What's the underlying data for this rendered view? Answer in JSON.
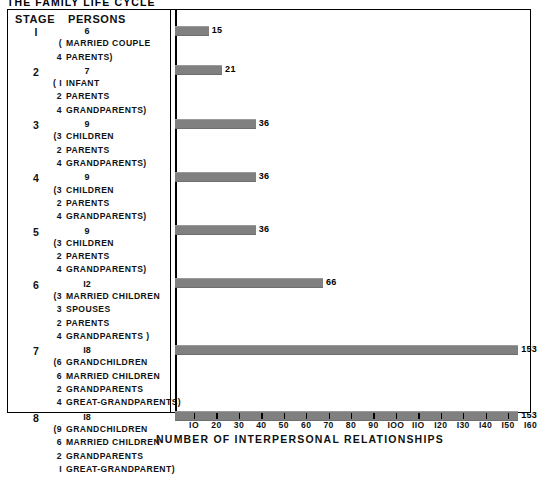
{
  "figure": {
    "title": "THE FAMILY LIFE CYCLE",
    "x_axis_title": "NUMBER OF INTERPERSONAL RELATIONSHIPS"
  },
  "table": {
    "headers": {
      "stage": "STAGE",
      "persons": "PERSONS"
    },
    "rows": [
      {
        "stage": "I",
        "persons": "6",
        "details": [
          {
            "count": "(",
            "text": "MARRIED COUPLE"
          },
          {
            "count": "4",
            "text": "PARENTS)"
          }
        ]
      },
      {
        "stage": "2",
        "persons": "7",
        "details": [
          {
            "count": "( I",
            "text": "INFANT"
          },
          {
            "count": "2",
            "text": "PARENTS"
          },
          {
            "count": "4",
            "text": "GRANDPARENTS)"
          }
        ]
      },
      {
        "stage": "3",
        "persons": "9",
        "details": [
          {
            "count": "(3",
            "text": "CHILDREN"
          },
          {
            "count": "2",
            "text": "PARENTS"
          },
          {
            "count": "4",
            "text": "GRANDPARENTS)"
          }
        ]
      },
      {
        "stage": "4",
        "persons": "9",
        "details": [
          {
            "count": "(3",
            "text": "CHILDREN"
          },
          {
            "count": "2",
            "text": "PARENTS"
          },
          {
            "count": "4",
            "text": "GRANDPARENTS)"
          }
        ]
      },
      {
        "stage": "5",
        "persons": "9",
        "details": [
          {
            "count": "(3",
            "text": "CHILDREN"
          },
          {
            "count": "2",
            "text": "PARENTS"
          },
          {
            "count": "4",
            "text": "GRANDPARENTS)"
          }
        ]
      },
      {
        "stage": "6",
        "persons": "I2",
        "details": [
          {
            "count": "(3",
            "text": "MARRIED CHILDREN"
          },
          {
            "count": "3",
            "text": "SPOUSES"
          },
          {
            "count": "2",
            "text": "PARENTS"
          },
          {
            "count": "4",
            "text": "GRANDPARENTS )"
          }
        ]
      },
      {
        "stage": "7",
        "persons": "I8",
        "details": [
          {
            "count": "(6",
            "text": "GRANDCHILDREN"
          },
          {
            "count": "6",
            "text": "MARRIED CHILDREN"
          },
          {
            "count": "2",
            "text": "GRANDPARENTS"
          },
          {
            "count": "4",
            "text": "GREAT-GRANDPARENTS)"
          }
        ]
      },
      {
        "stage": "8",
        "persons": "I8",
        "details": [
          {
            "count": "(9",
            "text": "GRANDCHILDREN"
          },
          {
            "count": "6",
            "text": "MARRIED CHILDREN"
          },
          {
            "count": "2",
            "text": "GRANDPARENTS"
          },
          {
            "count": "I",
            "text": "GREAT-GRANDPARENT)"
          }
        ]
      }
    ]
  },
  "chart_data": {
    "type": "bar",
    "orientation": "horizontal",
    "title": "THE FAMILY LIFE CYCLE",
    "xlabel": "NUMBER OF INTERPERSONAL RELATIONSHIPS",
    "ylabel": "STAGE",
    "categories": [
      "1",
      "2",
      "3",
      "4",
      "5",
      "6",
      "7",
      "8"
    ],
    "values": [
      15,
      21,
      36,
      36,
      36,
      66,
      153,
      153
    ],
    "value_labels": [
      "15",
      "21",
      "36",
      "36",
      "36",
      "66",
      "153",
      "153"
    ],
    "persons": [
      6,
      7,
      9,
      9,
      9,
      12,
      18,
      18
    ],
    "xlim": [
      0,
      160
    ],
    "xticks": [
      10,
      20,
      30,
      40,
      50,
      60,
      70,
      80,
      90,
      100,
      110,
      120,
      130,
      140,
      150,
      160
    ],
    "xtick_labels": [
      "IO",
      "20",
      "30",
      "40",
      "50",
      "60",
      "70",
      "80",
      "90",
      "IOO",
      "IIO",
      "I20",
      "I30",
      "I40",
      "I50",
      "I60"
    ],
    "grid": false,
    "legend": false,
    "bar_color": "#808080",
    "frame_color": "#000000"
  }
}
